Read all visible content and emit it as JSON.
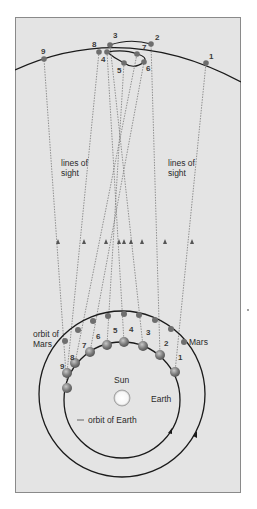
{
  "diagram": {
    "colors": {
      "panel_fill": "#e4e4e4",
      "panel_border": "#8a8a8a",
      "orbit_line": "#1a1a1a",
      "sight_line": "#7a7a7a",
      "planet_dot": "#6e6e6e",
      "earth_ball": "#8a8a8a",
      "sun_fill": "#ffffff"
    },
    "labels": {
      "lines_of_sight_left_1": "lines of",
      "lines_of_sight_left_2": "sight",
      "lines_of_sight_right_1": "lines of",
      "lines_of_sight_right_2": "sight",
      "orbit_of_mars_1": "orbit of",
      "orbit_of_mars_2": "Mars",
      "mars": "Mars",
      "sun": "Sun",
      "earth": "Earth",
      "orbit_of_earth": "orbit of Earth"
    },
    "apparent_positions": [
      {
        "n": "1",
        "x": 206,
        "y": 63,
        "lx": 209,
        "ly": 59
      },
      {
        "n": "2",
        "x": 151,
        "y": 44,
        "lx": 155,
        "ly": 40
      },
      {
        "n": "3",
        "x": 110,
        "y": 45,
        "lx": 113,
        "ly": 38
      },
      {
        "n": "4",
        "x": 107,
        "y": 52,
        "lx": 101,
        "ly": 62
      },
      {
        "n": "5",
        "x": 124,
        "y": 63,
        "lx": 117,
        "ly": 73
      },
      {
        "n": "6",
        "x": 144,
        "y": 62,
        "lx": 146,
        "ly": 71
      },
      {
        "n": "7",
        "x": 137,
        "y": 54,
        "lx": 142,
        "ly": 50
      },
      {
        "n": "8",
        "x": 99,
        "y": 52,
        "lx": 92,
        "ly": 47
      },
      {
        "n": "9",
        "x": 44,
        "y": 59,
        "lx": 41,
        "ly": 54
      }
    ],
    "mars_positions": [
      {
        "n": "1",
        "x": 184,
        "y": 342
      },
      {
        "n": "2",
        "x": 171,
        "y": 329
      },
      {
        "n": "3",
        "x": 155,
        "y": 320
      },
      {
        "n": "4",
        "x": 139,
        "y": 315
      },
      {
        "n": "5",
        "x": 124,
        "y": 314
      },
      {
        "n": "6",
        "x": 108,
        "y": 316
      },
      {
        "n": "7",
        "x": 93,
        "y": 321
      },
      {
        "n": "8",
        "x": 78,
        "y": 330
      },
      {
        "n": "9",
        "x": 65,
        "y": 341
      }
    ],
    "earth_positions": [
      {
        "n": "1",
        "x": 175,
        "y": 372,
        "lx": 178,
        "ly": 360
      },
      {
        "n": "2",
        "x": 160,
        "y": 355,
        "lx": 164,
        "ly": 346
      },
      {
        "n": "3",
        "x": 143,
        "y": 346,
        "lx": 146,
        "ly": 335
      },
      {
        "n": "4",
        "x": 124,
        "y": 342,
        "lx": 129,
        "ly": 332
      },
      {
        "n": "5",
        "x": 107,
        "y": 345,
        "lx": 113,
        "ly": 333
      },
      {
        "n": "6",
        "x": 90,
        "y": 352,
        "lx": 96,
        "ly": 339
      },
      {
        "n": "7",
        "x": 75,
        "y": 363,
        "lx": 82,
        "ly": 348
      },
      {
        "n": "8",
        "x": 67,
        "y": 373,
        "lx": 70,
        "ly": 360
      },
      {
        "n": "9",
        "x": 67,
        "y": 388,
        "lx": 60,
        "ly": 369
      }
    ]
  }
}
